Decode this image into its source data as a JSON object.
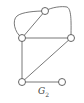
{
  "graph": {
    "name": "G",
    "subscript": "2",
    "nodes": [
      {
        "id": "a",
        "x": 45,
        "y": 11
      },
      {
        "id": "b",
        "x": 22,
        "y": 38
      },
      {
        "id": "c",
        "x": 71,
        "y": 38
      },
      {
        "id": "d",
        "x": 22,
        "y": 82
      },
      {
        "id": "e",
        "x": 62,
        "y": 82
      }
    ],
    "edges": [
      {
        "from": "a",
        "to": "b",
        "type": "straight"
      },
      {
        "from": "a",
        "to": "b",
        "type": "curved-left"
      },
      {
        "from": "a",
        "to": "c",
        "type": "curved-right"
      },
      {
        "from": "b",
        "to": "c",
        "type": "straight"
      },
      {
        "from": "b",
        "to": "d",
        "type": "straight"
      },
      {
        "from": "c",
        "to": "d",
        "type": "straight"
      },
      {
        "from": "d",
        "to": "e",
        "type": "straight"
      }
    ]
  }
}
